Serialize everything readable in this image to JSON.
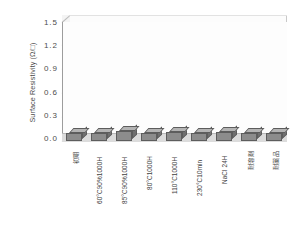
{
  "chart_data": {
    "type": "bar",
    "title": "",
    "xlabel": "",
    "ylabel": "Surface Resistivity (Ω/□)",
    "categories": [
      "初期",
      "60°C90%1000H",
      "85°C90%1000H",
      "80°C1000H",
      "110°C1000H",
      "230°C10min",
      "NaCl 24H",
      "耐溶剤",
      "耐薬品"
    ],
    "values": [
      0.1,
      0.1,
      0.13,
      0.1,
      0.11,
      0.1,
      0.11,
      0.1,
      0.1
    ],
    "ylim": [
      0.0,
      1.5
    ],
    "yticks": [
      "0.0",
      "0.3",
      "0.6",
      "0.9",
      "1.2",
      "1.5"
    ],
    "ytick_values": [
      0.0,
      0.3,
      0.6,
      0.9,
      1.2,
      1.5
    ],
    "grid": true,
    "legend": "none",
    "bar_color": "#8c8c8c",
    "bar_top_color": "#b4b4b4",
    "bar_side_color": "#6f6f6f",
    "bar_edge_color": "#5d5d5d",
    "plot_bg": "#fdfdfd",
    "grid_color": "#e2e2e2",
    "axis_color": "#9d9d9d",
    "text_color": "#3f3f3f",
    "style": "3d-column"
  }
}
